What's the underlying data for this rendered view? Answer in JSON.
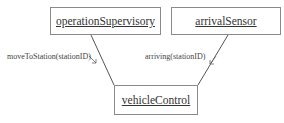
{
  "diagram": {
    "type": "communication",
    "objects": [
      {
        "id": "operationSupervisory",
        "label": "operationSupervisory"
      },
      {
        "id": "arrivalSensor",
        "label": "arrivalSensor"
      },
      {
        "id": "vehicleControl",
        "label": "vehicleControl"
      }
    ],
    "messages": [
      {
        "from": "operationSupervisory",
        "to": "vehicleControl",
        "label": "moveToStation(stationID)"
      },
      {
        "from": "arrivalSensor",
        "to": "vehicleControl",
        "label": "arriving(stationID)"
      }
    ]
  }
}
